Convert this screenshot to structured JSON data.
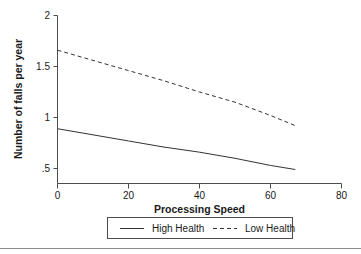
{
  "chart_data": {
    "type": "line",
    "title": "",
    "xlabel": "Processing Speed",
    "ylabel": "Number of falls per year",
    "xlim": [
      0,
      80
    ],
    "ylim": [
      0.42,
      2.05
    ],
    "xticks": [
      0,
      20,
      40,
      60,
      80
    ],
    "xtick_labels": [
      "0",
      "20",
      "40",
      "60",
      "80"
    ],
    "yticks": [
      0.5,
      1,
      1.5,
      2
    ],
    "ytick_labels": [
      ".5",
      "1",
      "1.5",
      "2"
    ],
    "grid": false,
    "legend_position": "below-axes",
    "x": [
      0,
      10,
      20,
      30,
      40,
      50,
      60,
      67
    ],
    "series": [
      {
        "name": "High Health",
        "style": "solid",
        "values": [
          0.89,
          0.83,
          0.77,
          0.71,
          0.66,
          0.6,
          0.53,
          0.49
        ]
      },
      {
        "name": "Low Health",
        "style": "dashed",
        "values": [
          1.66,
          1.56,
          1.46,
          1.36,
          1.25,
          1.15,
          1.02,
          0.92
        ]
      }
    ]
  },
  "legend": {
    "entries": [
      {
        "label": "High Health",
        "style": "solid"
      },
      {
        "label": "Low Health",
        "style": "dashed"
      }
    ]
  },
  "axes": {
    "x_title": "Processing Speed",
    "y_title": "Number of falls per year",
    "xtick_labels": [
      "0",
      "20",
      "40",
      "60",
      "80"
    ],
    "ytick_labels": [
      ".5",
      "1",
      "1.5",
      "2"
    ]
  },
  "colors": {
    "line": "#333333",
    "axis": "#4d4d4d",
    "text": "#1a1a1a",
    "background": "#ffffff",
    "footer_rule": "#8c8c8c"
  }
}
